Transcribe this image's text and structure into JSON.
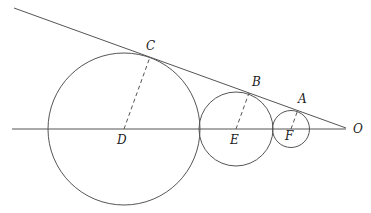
{
  "diagram": {
    "type": "geometry",
    "colors": {
      "stroke": "#555555",
      "text": "#222222",
      "background": "#ffffff"
    },
    "lines": [
      {
        "name": "tangent-line",
        "from": [
          14,
          8
        ],
        "to": [
          346,
          128
        ],
        "style": "solid"
      },
      {
        "name": "center-line",
        "from": [
          12,
          129
        ],
        "to": [
          346,
          129
        ],
        "style": "solid"
      }
    ],
    "circles": [
      {
        "name": "circle-D",
        "center": "D",
        "cx": 124,
        "cy": 129,
        "r": 76
      },
      {
        "name": "circle-E",
        "center": "E",
        "cx": 236,
        "cy": 129,
        "r": 37
      },
      {
        "name": "circle-F",
        "center": "F",
        "cx": 291,
        "cy": 129,
        "r": 18.5
      }
    ],
    "radii": [
      {
        "name": "radius-DC",
        "from": "D",
        "to": "C",
        "style": "dashed"
      },
      {
        "name": "radius-EB",
        "from": "E",
        "to": "B",
        "style": "dashed"
      },
      {
        "name": "radius-FA",
        "from": "F",
        "to": "A",
        "style": "dashed"
      }
    ],
    "points": {
      "A": {
        "x": 297.5,
        "y": 111,
        "label": "A",
        "lx": 298,
        "ly": 103
      },
      "B": {
        "x": 249,
        "y": 93,
        "label": "B",
        "lx": 252,
        "ly": 86
      },
      "C": {
        "x": 150,
        "y": 57,
        "label": "C",
        "lx": 146,
        "ly": 50
      },
      "D": {
        "x": 124,
        "y": 129,
        "label": "D",
        "lx": 117,
        "ly": 144
      },
      "E": {
        "x": 236,
        "y": 129,
        "label": "E",
        "lx": 230,
        "ly": 144
      },
      "F": {
        "x": 291,
        "y": 129,
        "label": "F",
        "lx": 285,
        "ly": 140
      },
      "O": {
        "x": 346,
        "y": 128,
        "label": "O",
        "lx": 353,
        "ly": 133
      }
    }
  }
}
